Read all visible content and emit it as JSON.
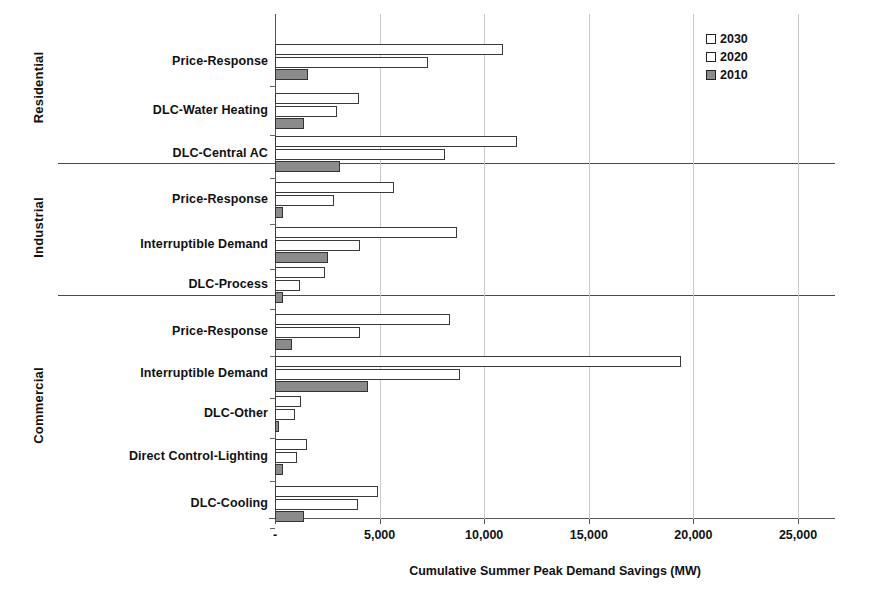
{
  "chart_data": {
    "type": "bar",
    "orientation": "horizontal",
    "title": "",
    "xlabel": "Cumulative Summer Peak Demand Savings (MW)",
    "ylabel": "",
    "xlim": [
      0,
      25000
    ],
    "xticks": [
      0,
      5000,
      10000,
      15000,
      20000,
      25000
    ],
    "xticklabels": [
      "-",
      "5,000",
      "10,000",
      "15,000",
      "20,000",
      "25,000"
    ],
    "grid": true,
    "legend_position": "top-right",
    "series": [
      {
        "name": "2030",
        "fill": "#ffffff",
        "edge": "#3a3a3a"
      },
      {
        "name": "2020",
        "fill": "#ffffff",
        "edge": "#3a3a3a"
      },
      {
        "name": "2010",
        "fill": "#8b8b8b",
        "edge": "#333333"
      }
    ],
    "sectors": [
      {
        "name": "Residential",
        "categories": [
          {
            "label": "Price-Response",
            "values": {
              "2030": 10900,
              "2020": 7300,
              "2010": 1600
            }
          },
          {
            "label": "DLC-Water Heating",
            "values": {
              "2030": 4000,
              "2020": 2950,
              "2010": 1400
            }
          },
          {
            "label": "DLC-Central AC",
            "values": {
              "2030": 11550,
              "2020": 8150,
              "2010": 3100
            }
          }
        ]
      },
      {
        "name": "Industrial",
        "categories": [
          {
            "label": "Price-Response",
            "values": {
              "2030": 5700,
              "2020": 2800,
              "2010": 400
            }
          },
          {
            "label": "Interruptible Demand",
            "values": {
              "2030": 8700,
              "2020": 4050,
              "2010": 2550
            }
          },
          {
            "label": "DLC-Process",
            "values": {
              "2030": 2400,
              "2020": 1200,
              "2010": 400
            }
          }
        ]
      },
      {
        "name": "Commercial",
        "categories": [
          {
            "label": "Price-Response",
            "values": {
              "2030": 8350,
              "2020": 4050,
              "2010": 800
            }
          },
          {
            "label": "Interruptible Demand",
            "values": {
              "2030": 19400,
              "2020": 8850,
              "2010": 4450
            }
          },
          {
            "label": "DLC-Other",
            "values": {
              "2030": 1250,
              "2020": 950,
              "2010": 200
            }
          },
          {
            "label": "Direct Control-Lighting",
            "values": {
              "2030": 1550,
              "2020": 1050,
              "2010": 400
            }
          },
          {
            "label": "DLC-Cooling",
            "values": {
              "2030": 4900,
              "2020": 3950,
              "2010": 1400
            }
          }
        ]
      }
    ]
  },
  "legend": {
    "items": [
      {
        "label": "2030"
      },
      {
        "label": "2020"
      },
      {
        "label": "2010"
      }
    ]
  }
}
